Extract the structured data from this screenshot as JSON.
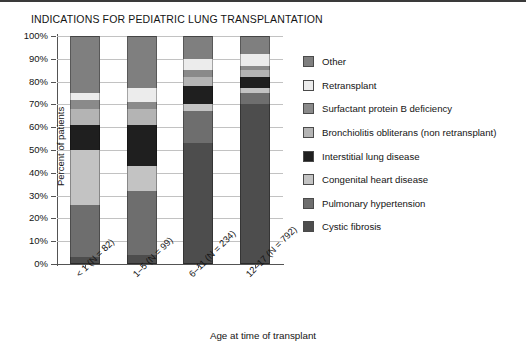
{
  "chart_data": {
    "type": "bar",
    "subtype": "stacked-percent",
    "title": "INDICATIONS FOR PEDIATRIC LUNG TRANSPLANTATION",
    "xlabel": "Age at time of transplant",
    "ylabel": "Percent of patients",
    "ylim": [
      0,
      100
    ],
    "grid": true,
    "legend_position": "right",
    "ytick_labels": [
      "100%",
      "90%",
      "80%",
      "70%",
      "60%",
      "50%",
      "40%",
      "30%",
      "20%",
      "10%",
      "0%"
    ],
    "ytick_values": [
      100,
      90,
      80,
      70,
      60,
      50,
      40,
      30,
      20,
      10,
      0
    ],
    "categories": [
      "< 1 (N = 82)",
      "1–5 (N = 99)",
      "6–11 (N = 234)",
      "12–17 (N = 792)"
    ],
    "series": [
      {
        "name": "Cystic fibrosis",
        "color": "#4d4d4d",
        "values": [
          3,
          4,
          53,
          70
        ]
      },
      {
        "name": "Pulmonary hypertension",
        "color": "#6e6e6e",
        "values": [
          23,
          28,
          14,
          5
        ]
      },
      {
        "name": "Congenital heart disease",
        "color": "#c3c3c3",
        "values": [
          24,
          11,
          3,
          2
        ]
      },
      {
        "name": "Interstitial lung disease",
        "color": "#1f1f1f",
        "values": [
          11,
          18,
          8,
          5
        ]
      },
      {
        "name": "Bronchiolitis obliterans (non retransplant)",
        "color": "#b4b4b4",
        "values": [
          7,
          7,
          4,
          3
        ]
      },
      {
        "name": "Surfactant protein B deficiency",
        "color": "#8a8a8a",
        "values": [
          4,
          3,
          3,
          2
        ]
      },
      {
        "name": "Retransplant",
        "color": "#ececec",
        "values": [
          3,
          6,
          5,
          5
        ]
      },
      {
        "name": "Other",
        "color": "#7f7f7f",
        "values": [
          25,
          23,
          10,
          8
        ]
      }
    ],
    "legend_entries": [
      {
        "label": "Other",
        "color": "#7f7f7f"
      },
      {
        "label": "Retransplant",
        "color": "#ececec"
      },
      {
        "label": "Surfactant protein B deficiency",
        "color": "#8a8a8a"
      },
      {
        "label": "Bronchiolitis obliterans (non retransplant)",
        "color": "#b4b4b4"
      },
      {
        "label": "Interstitial lung disease",
        "color": "#1f1f1f"
      },
      {
        "label": "Congenital heart disease",
        "color": "#c3c3c3"
      },
      {
        "label": "Pulmonary hypertension",
        "color": "#6e6e6e"
      },
      {
        "label": "Cystic fibrosis",
        "color": "#4d4d4d"
      }
    ]
  }
}
